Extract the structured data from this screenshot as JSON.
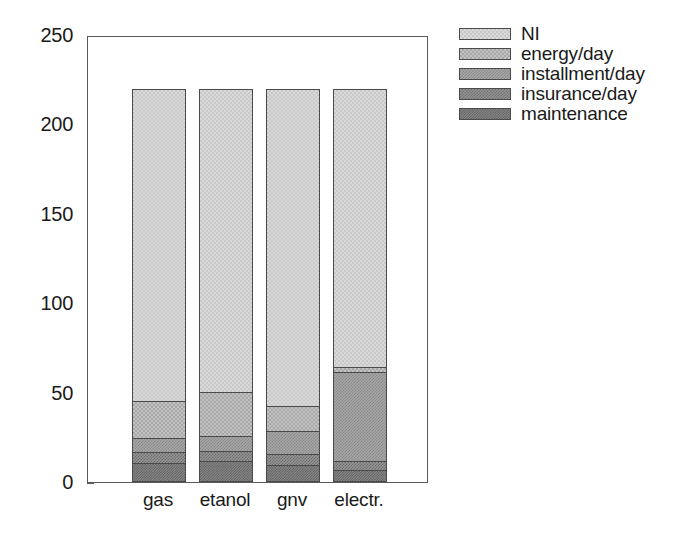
{
  "chart_data": {
    "type": "bar",
    "subtype": "stacked-bar",
    "title": "",
    "xlabel": "",
    "ylabel": "",
    "categories": [
      "gas",
      "etanol",
      "gnv",
      "electr."
    ],
    "ylim": [
      0,
      250
    ],
    "yticks": [
      0,
      50,
      100,
      150,
      200,
      250
    ],
    "ytick_labels": [
      "0",
      "50",
      "100",
      "150",
      "200",
      "250"
    ],
    "grid": false,
    "legend_position": "right",
    "stack_order_bottom_to_top": [
      "maintenance",
      "insurance/day",
      "installment/day",
      "energy/day",
      "NI"
    ],
    "series": [
      {
        "name": "maintenance",
        "values": [
          10,
          11,
          9,
          6
        ]
      },
      {
        "name": "insurance/day",
        "values": [
          6,
          6,
          6,
          5
        ]
      },
      {
        "name": "installment/day",
        "values": [
          8,
          8,
          13,
          50
        ]
      },
      {
        "name": "energy/day",
        "values": [
          21,
          25,
          14,
          3
        ]
      },
      {
        "name": "NI",
        "values": [
          174,
          169,
          177,
          155
        ]
      }
    ],
    "totals": [
      219,
      219,
      219,
      219
    ],
    "colors": {
      "NI": "#d9d9d9",
      "energy/day": "#c2c2c2",
      "installment/day": "#a6a6a6",
      "insurance/day": "#949494",
      "maintenance": "#878787",
      "axis": "#5a5a5a",
      "text": "#1a1a1a",
      "background": "#ffffff"
    }
  },
  "axis": {
    "y_ticks": [
      {
        "label": "250",
        "value": 250
      },
      {
        "label": "200",
        "value": 200
      },
      {
        "label": "150",
        "value": 150
      },
      {
        "label": "100",
        "value": 100
      },
      {
        "label": "50",
        "value": 50
      },
      {
        "label": "0",
        "value": 0
      }
    ],
    "x_labels": [
      "gas",
      "etanol",
      "gnv",
      "electr."
    ]
  },
  "legend": {
    "items": [
      {
        "label": "NI",
        "key": "NI"
      },
      {
        "label": "energy/day",
        "key": "energy/day"
      },
      {
        "label": "installment/day",
        "key": "installment/day"
      },
      {
        "label": "insurance/day",
        "key": "insurance/day"
      },
      {
        "label": "maintenance",
        "key": "maintenance"
      }
    ]
  }
}
